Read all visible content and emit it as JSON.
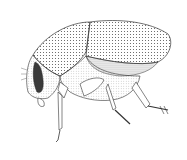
{
  "image": {
    "subject": "beetle",
    "style": "stippled black-and-white scientific illustration",
    "view": "lateral",
    "colors": {
      "background": "#ffffff",
      "ink": "#222222",
      "eye": "#333333",
      "shade": "#bdbdbd"
    }
  }
}
